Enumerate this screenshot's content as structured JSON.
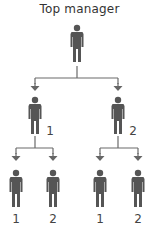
{
  "diagram": {
    "title": "Top manager",
    "colors": {
      "figure": "#555555",
      "line": "#6a6a6a",
      "text": "#333333"
    },
    "root": {
      "label": "Top manager",
      "icon": "person-icon"
    },
    "level1": [
      {
        "label": "1",
        "icon": "person-icon"
      },
      {
        "label": "2",
        "icon": "person-icon"
      }
    ],
    "level2": [
      {
        "parent": "1",
        "label": "1",
        "icon": "person-icon"
      },
      {
        "parent": "1",
        "label": "2",
        "icon": "person-icon"
      },
      {
        "parent": "2",
        "label": "1",
        "icon": "person-icon"
      },
      {
        "parent": "2",
        "label": "2",
        "icon": "person-icon"
      }
    ]
  }
}
